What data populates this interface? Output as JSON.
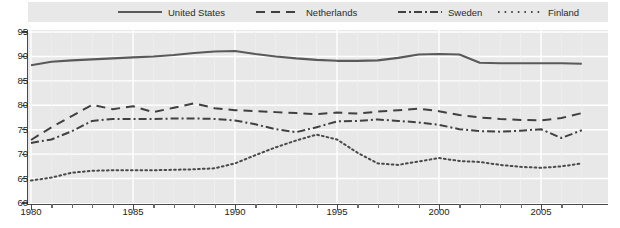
{
  "chart_data": {
    "type": "line",
    "title": "",
    "xlabel": "",
    "ylabel": "",
    "xlim": [
      1980,
      2007
    ],
    "ylim": [
      60,
      95
    ],
    "ytick_labels": [
      "95",
      "90",
      "85",
      "80",
      "75",
      "70",
      "65",
      "60"
    ],
    "ytick_values": [
      95,
      90,
      85,
      80,
      75,
      70,
      65,
      60
    ],
    "xtick_labels": [
      "1980",
      "1985",
      "1990",
      "1995",
      "2000",
      "2005"
    ],
    "xtick_values": [
      1980,
      1985,
      1990,
      1995,
      2000,
      2005
    ],
    "grid": true,
    "legend_position": "top",
    "x": [
      1980,
      1981,
      1982,
      1983,
      1984,
      1985,
      1986,
      1987,
      1988,
      1989,
      1990,
      1991,
      1992,
      1993,
      1994,
      1995,
      1996,
      1997,
      1998,
      1999,
      2000,
      2001,
      2002,
      2003,
      2004,
      2005,
      2006,
      2007
    ],
    "series": [
      {
        "name": "United States",
        "style": "solid",
        "color": "#595959",
        "values": [
          88.2,
          88.9,
          89.2,
          89.4,
          89.6,
          89.8,
          90.0,
          90.3,
          90.7,
          91.0,
          91.1,
          90.5,
          90.0,
          89.6,
          89.3,
          89.1,
          89.1,
          89.2,
          89.7,
          90.4,
          90.5,
          90.4,
          88.7,
          88.6,
          88.6,
          88.6,
          88.6,
          88.5
        ]
      },
      {
        "name": "Netherlands",
        "style": "dashed",
        "color": "#404040",
        "values": [
          72.9,
          75.5,
          77.8,
          80.1,
          79.2,
          79.8,
          78.6,
          79.5,
          80.4,
          79.4,
          79.0,
          78.8,
          78.6,
          78.4,
          78.2,
          78.5,
          78.3,
          78.7,
          79.0,
          79.3,
          78.8,
          78.0,
          77.5,
          77.2,
          77.0,
          76.9,
          77.4,
          78.4
        ]
      },
      {
        "name": "Sweden",
        "style": "dashdot",
        "color": "#404040",
        "values": [
          72.3,
          73.0,
          74.7,
          76.8,
          77.2,
          77.2,
          77.2,
          77.3,
          77.3,
          77.2,
          76.9,
          76.1,
          75.1,
          74.5,
          75.5,
          76.7,
          76.8,
          77.1,
          76.8,
          76.5,
          76.0,
          75.1,
          74.7,
          74.6,
          74.8,
          75.1,
          73.3,
          74.9
        ]
      },
      {
        "name": "Finland",
        "style": "dotted",
        "color": "#4a4a4a",
        "values": [
          64.6,
          65.2,
          66.2,
          66.6,
          66.7,
          66.7,
          66.7,
          66.8,
          66.9,
          67.1,
          68.1,
          69.8,
          71.4,
          72.8,
          74.0,
          73.0,
          70.3,
          68.1,
          67.8,
          68.5,
          69.2,
          68.6,
          68.4,
          67.8,
          67.4,
          67.2,
          67.5,
          68.1
        ]
      }
    ]
  },
  "legend": {
    "items": [
      {
        "label": "United States",
        "style": "solid"
      },
      {
        "label": "Netherlands",
        "style": "dashed"
      },
      {
        "label": "Sweden",
        "style": "dashdot"
      },
      {
        "label": "Finland",
        "style": "dotted"
      }
    ]
  },
  "colors": {
    "plot_background": "#e8e8e8",
    "page_background": "#ffffff",
    "gridline": "#ffffff",
    "axis": "#4a4a4a",
    "text": "#1d1d1d"
  }
}
